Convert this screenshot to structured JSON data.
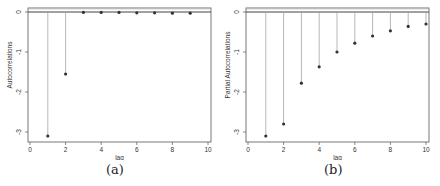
{
  "chart_data": [
    {
      "id": "a",
      "type": "scatter",
      "style": "stem",
      "caption": "(a)",
      "title": "",
      "xlabel": "lag",
      "ylabel": "Autocorrelations",
      "x": [
        1,
        2,
        3,
        4,
        5,
        6,
        7,
        8,
        9
      ],
      "values": [
        -3.1,
        -1.55,
        -0.01,
        -0.01,
        -0.01,
        -0.02,
        -0.02,
        -0.03,
        -0.03
      ],
      "xlim": [
        0,
        10
      ],
      "ylim": [
        -3.15,
        0.1
      ],
      "xticks": [
        0,
        2,
        4,
        6,
        8,
        10
      ],
      "yticks": [
        0,
        -1,
        -2,
        -3
      ],
      "reference_line": 0,
      "grid": false,
      "legend": null
    },
    {
      "id": "b",
      "type": "scatter",
      "style": "stem",
      "caption": "(b)",
      "title": "",
      "xlabel": "lag",
      "ylabel": "Partial Autocorrelations",
      "x": [
        1,
        2,
        3,
        4,
        5,
        6,
        7,
        8,
        9,
        10
      ],
      "values": [
        -3.1,
        -2.8,
        -1.78,
        -1.37,
        -1.0,
        -0.78,
        -0.6,
        -0.47,
        -0.36,
        -0.3
      ],
      "xlim": [
        0,
        10
      ],
      "ylim": [
        -3.15,
        0.1
      ],
      "xticks": [
        0,
        2,
        4,
        6,
        8,
        10
      ],
      "yticks": [
        0,
        -1,
        -2,
        -3
      ],
      "reference_line": 0,
      "grid": false,
      "legend": null
    }
  ],
  "panels": {
    "a": {
      "caption": "(a)",
      "xlabel": "lag",
      "ylabel": "Autocorrelations"
    },
    "b": {
      "caption": "(b)",
      "xlabel": "lag",
      "ylabel": "Partial Autocorrelations"
    }
  },
  "colors": {
    "frame": "#555555",
    "stem": "#9a9a9a",
    "point": "#333333",
    "zero_line": "#444444",
    "text": "#333333"
  }
}
